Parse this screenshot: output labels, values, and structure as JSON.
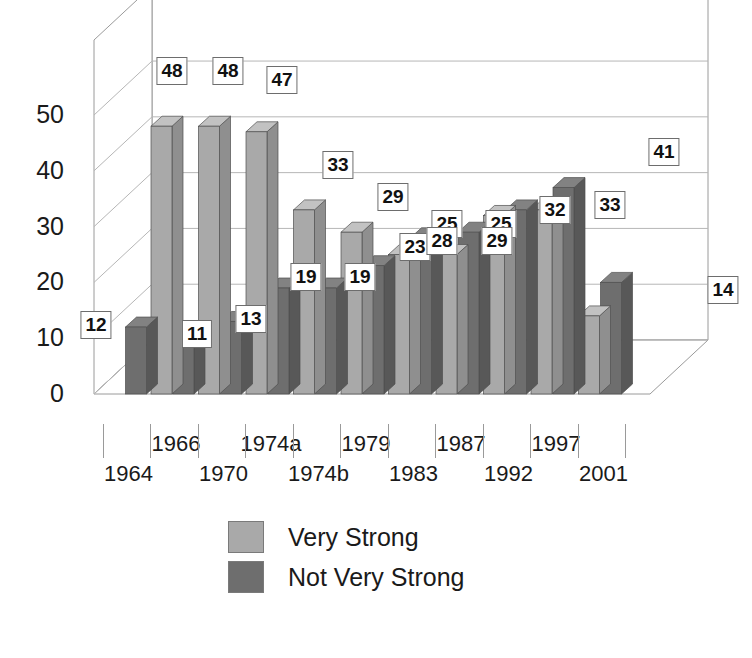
{
  "chart_data": {
    "type": "bar",
    "title": "",
    "xlabel": "",
    "ylabel": "",
    "ylim": [
      0,
      57
    ],
    "yticks": [
      0,
      10,
      20,
      30,
      40,
      50
    ],
    "grid": true,
    "legend_position": "bottom-center",
    "three_d": true,
    "categories": [
      "1964",
      "1966",
      "1970",
      "1974a",
      "1974b",
      "1979",
      "1983",
      "1987",
      "1992",
      "1997",
      "2001"
    ],
    "series": [
      {
        "name": "Very Strong",
        "color": "#a9a9a9",
        "side_color": "#8f8f8f",
        "top_color": "#c2c2c2",
        "values": [
          null,
          48,
          48,
          47,
          33,
          29,
          25,
          25,
          32,
          33,
          14
        ]
      },
      {
        "name": "Not Very Strong",
        "color": "#6e6e6e",
        "side_color": "#585858",
        "top_color": "#828282",
        "values": [
          12,
          11,
          13,
          19,
          19,
          23,
          28,
          29,
          33,
          37,
          20
        ]
      }
    ],
    "data_labels": [
      {
        "text": "12",
        "x": 20,
        "y": 289,
        "series": "Not Very Strong",
        "category": "1964"
      },
      {
        "text": "48",
        "x": 96,
        "y": 35,
        "series": "Very Strong",
        "category": "1966"
      },
      {
        "text": "11",
        "x": 121,
        "y": 298,
        "series": "Not Very Strong",
        "category": "1966"
      },
      {
        "text": "48",
        "x": 152,
        "y": 35,
        "series": "Very Strong",
        "category": "1970"
      },
      {
        "text": "13",
        "x": 175,
        "y": 283,
        "series": "Not Very Strong",
        "category": "1970"
      },
      {
        "text": "47",
        "x": 206,
        "y": 44,
        "series": "Very Strong",
        "category": "1974a"
      },
      {
        "text": "19",
        "x": 230,
        "y": 241,
        "series": "Not Very Strong",
        "category": "1974a"
      },
      {
        "text": "33",
        "x": 262,
        "y": 129,
        "series": "Very Strong",
        "category": "1974b"
      },
      {
        "text": "19",
        "x": 284,
        "y": 241,
        "series": "Not Very Strong",
        "category": "1974b"
      },
      {
        "text": "29",
        "x": 317,
        "y": 161,
        "series": "Very Strong",
        "category": "1979"
      },
      {
        "text": "23",
        "x": 339,
        "y": 211,
        "series": "Not Very Strong",
        "category": "1979"
      },
      {
        "text": "25",
        "x": 371,
        "y": 188,
        "series": "Very Strong",
        "category": "1983"
      },
      {
        "text": "28",
        "x": 366,
        "y": 205,
        "series": "Not Very Strong",
        "category": "1983"
      },
      {
        "text": "25",
        "x": 425,
        "y": 188,
        "series": "Very Strong",
        "category": "1987"
      },
      {
        "text": "29",
        "x": 421,
        "y": 205,
        "series": "Not Very Strong",
        "category": "1987"
      },
      {
        "text": "32",
        "x": 479,
        "y": 174,
        "series": "Very Strong",
        "category": "1992"
      },
      {
        "text": "33",
        "x": 534,
        "y": 169,
        "series": "Very Strong",
        "category": "1997"
      },
      {
        "text": "41",
        "x": 588,
        "y": 116,
        "series": "Very Strong",
        "category": "2001"
      },
      {
        "text": "14",
        "x": 647,
        "y": 254,
        "series": "Very Strong",
        "category": "2001"
      }
    ]
  },
  "axis": {
    "y_labels": [
      "50",
      "40",
      "30",
      "20",
      "10",
      "0"
    ],
    "x_labels_top_row": [
      "1966",
      "1974a",
      "1979",
      "1987",
      "1997"
    ],
    "x_labels_bottom_row": [
      "1964",
      "1970",
      "1974b",
      "1983",
      "1992",
      "2001"
    ]
  },
  "legend": {
    "items": [
      {
        "label": "Very Strong",
        "color": "#a9a9a9"
      },
      {
        "label": "Not Very Strong",
        "color": "#6e6e6e"
      }
    ]
  }
}
